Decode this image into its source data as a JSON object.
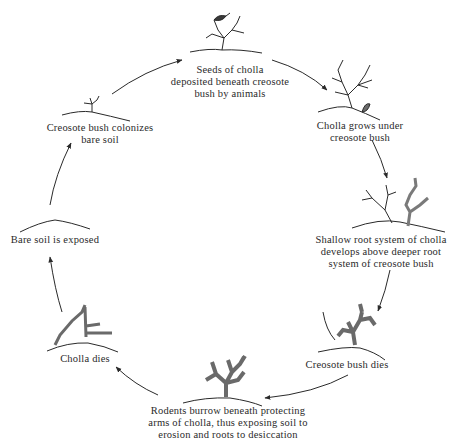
{
  "diagram": {
    "type": "cycle",
    "title": "",
    "stages": [
      {
        "id": "seeds",
        "lines": [
          "Seeds of cholla",
          "deposited beneath creosote",
          "bush by animals"
        ]
      },
      {
        "id": "cholla-grows",
        "lines": [
          "Cholla grows under",
          "creosote bush"
        ]
      },
      {
        "id": "shallow-roots",
        "lines": [
          "Shallow root system of cholla",
          "develops above deeper root",
          "system of creosote bush"
        ]
      },
      {
        "id": "creosote-dies",
        "lines": [
          "Creosote bush dies"
        ]
      },
      {
        "id": "rodents",
        "lines": [
          "Rodents burrow beneath protecting",
          "arms of cholla, thus exposing soil to",
          "erosion and roots to desiccation"
        ]
      },
      {
        "id": "cholla-dies",
        "lines": [
          "Cholla dies"
        ]
      },
      {
        "id": "bare-soil",
        "lines": [
          "Bare soil is exposed"
        ]
      },
      {
        "id": "creosote-colonizes",
        "lines": [
          "Creosote bush colonizes",
          "bare soil"
        ]
      }
    ],
    "colors": {
      "line": "#2a2a2a",
      "background": "#ffffff",
      "cholla_fill": "#8a8a8a"
    }
  }
}
